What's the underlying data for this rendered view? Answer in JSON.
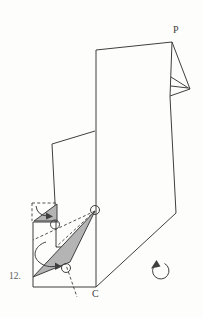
{
  "diagram": {
    "step_label": "12.",
    "labels": {
      "point_p": "P",
      "point_c": "C"
    },
    "colors": {
      "line": "#3f3f3f",
      "shade": "#b4b4b4",
      "background": "#fdfdfc",
      "step_text": "#5a5a5a",
      "point_text": "#3d3d3d"
    },
    "icons": [
      "fold-arrow-small-icon",
      "fold-arrow-large-icon",
      "rotate-counterclockwise-icon"
    ],
    "shapes": [
      {
        "name": "paper-main-outline",
        "type": "polygon",
        "points": "96,50 172,42 170,97 176,213 96,287",
        "fill": "none",
        "dashed": false
      },
      {
        "name": "corner-flap-outer-edge",
        "type": "polyline",
        "points": "172,42 190,89 171,77",
        "fill": "none",
        "dashed": false
      },
      {
        "name": "corner-flap-lower-edge",
        "type": "polyline",
        "points": "190,89 170,96",
        "fill": "none",
        "dashed": false
      },
      {
        "name": "corner-flap-inner-crease",
        "type": "polyline",
        "points": "171,86 188,88",
        "fill": "none",
        "dashed": false
      },
      {
        "name": "middle-flap-outline",
        "type": "polyline",
        "points": "95,131 52,144 56,222 56,247 62,247",
        "fill": "none",
        "dashed": false
      },
      {
        "name": "lower-left-panel-outline",
        "type": "polyline",
        "points": "58,222 33,222 33,287 96,287",
        "fill": "none",
        "dashed": false
      },
      {
        "name": "ghost-flap-top-edge",
        "type": "polyline",
        "points": "32,203 56,203",
        "fill": "none",
        "dashed": true
      },
      {
        "name": "ghost-flap-left-edge",
        "type": "polyline",
        "points": "32,203 32,221",
        "fill": "none",
        "dashed": true
      },
      {
        "name": "valley-fold-upper",
        "type": "polyline",
        "points": "95,211 33,240",
        "fill": "none",
        "dashed": true
      },
      {
        "name": "valley-fold-lower",
        "type": "polyline",
        "points": "95,211 56,247",
        "fill": "none",
        "dashed": true
      },
      {
        "name": "hidden-edge-extension",
        "type": "polyline",
        "points": "65,262 77,297",
        "fill": "none",
        "dashed": true
      },
      {
        "name": "small-shaded-triangle",
        "type": "polygon",
        "points": "34,221 57,204 57,221",
        "fill": "shade",
        "dashed": false
      },
      {
        "name": "large-shaded-triangle",
        "type": "polygon",
        "points": "95,211 33,277 70,262",
        "fill": "shade",
        "dashed": false
      },
      {
        "name": "pivot-circle-left",
        "type": "circle",
        "cx": 55,
        "cy": 224.5,
        "r": 4.5
      },
      {
        "name": "pivot-circle-top",
        "type": "circle",
        "cx": 95,
        "cy": 210,
        "r": 4.5
      },
      {
        "name": "pivot-circle-bottom",
        "type": "circle",
        "cx": 66,
        "cy": 268,
        "r": 4.5
      },
      {
        "name": "fold-arrow-small-icon",
        "type": "path",
        "d": "M 36,206 Q 37,215 47,216",
        "fill": "none",
        "dashed": false
      },
      {
        "name": "fold-arrow-small-head",
        "type": "polygon",
        "points": "46,212.5 53,216.5 46,219.5",
        "fill": "line",
        "dashed": false,
        "nostroke": true
      },
      {
        "name": "fold-arrow-large-icon",
        "type": "path",
        "d": "M 46,242 C 36,245 31,255 39,262 C 44,266.5 51,267.5 56,266",
        "fill": "none",
        "dashed": false
      },
      {
        "name": "fold-arrow-large-head",
        "type": "polygon",
        "points": "55,262.5 62,266.5 55,270",
        "fill": "line",
        "dashed": false,
        "nostroke": true
      },
      {
        "name": "rotate-counterclockwise-icon",
        "type": "path",
        "d": "M 164.5,263.5 A 8.2,8.2 0 1 1 155.5,264.5",
        "fill": "none",
        "dashed": false
      },
      {
        "name": "rotate-arrow-head",
        "type": "polygon",
        "points": "151,268.5 156.5,260 160.5,266.5",
        "fill": "line",
        "dashed": false,
        "nostroke": true
      }
    ]
  }
}
